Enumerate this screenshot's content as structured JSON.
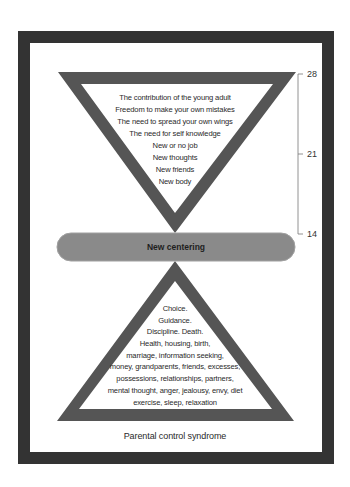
{
  "colors": {
    "frame": "#333333",
    "triangle_border": "#555555",
    "pill_fill": "#8a8a8a",
    "pill_edge": "#a0a0a0",
    "scale_line": "#777777"
  },
  "top_triangle": {
    "lines": [
      "The contribution of the young adult",
      "Freedom to make your own mistakes",
      "The need to spread your own wings",
      "The need for self knowledge",
      "New or no job",
      "New thoughts",
      "New friends",
      "New body"
    ]
  },
  "center_band": {
    "label": "New centering"
  },
  "bottom_triangle": {
    "lines": [
      "Choice.",
      "Guidance.",
      "Discipline. Death.",
      "Health, housing, birth,",
      "marriage, information seeking,",
      "money, grandparents, friends, excesses,",
      "possessions, relationships, partners,",
      "mental thought, anger, jealousy, envy, diet",
      "exercise, sleep, relaxation"
    ]
  },
  "age_scale": {
    "ticks": [
      {
        "label": "28"
      },
      {
        "label": "21"
      },
      {
        "label": "14"
      }
    ]
  },
  "caption": "Parental control syndrome"
}
